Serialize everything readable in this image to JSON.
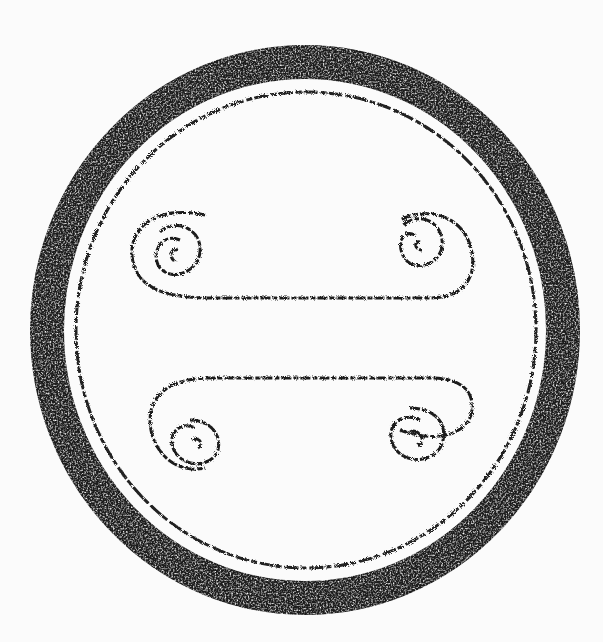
{
  "image": {
    "subject": "ink rubbing of circular tile end with four spiral scroll motifs",
    "width": 603,
    "height": 642,
    "colors": {
      "ink": "#1a1a1a",
      "paper": "#fbfbfb"
    },
    "motifs": [
      "upper-left-spiral",
      "upper-right-spiral",
      "lower-left-spiral",
      "lower-right-spiral"
    ]
  }
}
